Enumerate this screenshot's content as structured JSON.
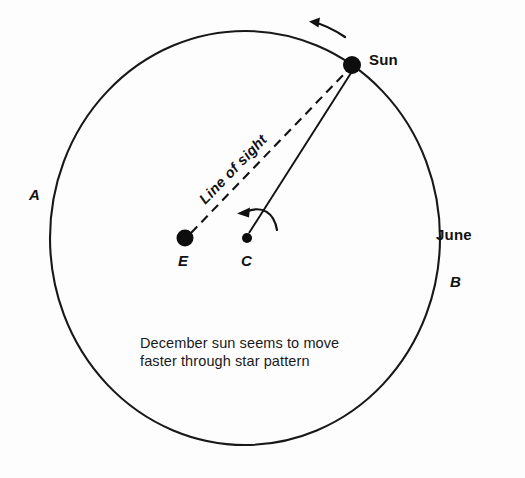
{
  "figure": {
    "title_text": "December sun seems to move faster through star pattern",
    "background_color": "#fdfdfd",
    "ink_color": "#111111"
  },
  "labels": {
    "sun": "Sun",
    "point_a": "A",
    "point_b": "B",
    "month_june": "June",
    "earth": "E",
    "center": "C",
    "line_of_sight": "Line of sight",
    "caption_line_1": "December sun seems to move",
    "caption_line_2": "faster through star pattern"
  },
  "geometry": {
    "orbit_circle": {
      "cx": 245,
      "cy": 238,
      "rx": 195,
      "ry": 207
    },
    "sun_marker": {
      "cx": 352,
      "cy": 65,
      "r": 9
    },
    "earth_marker": {
      "cx": 185,
      "cy": 238,
      "r": 8.5
    },
    "center_marker": {
      "cx": 247,
      "cy": 238,
      "r": 5
    },
    "line_of_sight_dashed": {
      "x1": 190,
      "y1": 234,
      "x2": 348,
      "y2": 70
    },
    "radius_line_solid": {
      "x1": 249,
      "y1": 233,
      "x2": 352,
      "y2": 72
    },
    "orbit_direction_arrow": "counterclockwise-arc-top-right",
    "rotation_arrow": "counterclockwise-arc-at-C"
  }
}
